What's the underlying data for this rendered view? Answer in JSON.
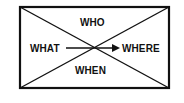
{
  "diagram": {
    "labels": {
      "top": "WHO",
      "left": "WHAT",
      "right": "WHERE",
      "bottom": "WHEN"
    },
    "stroke_color": "#111111",
    "background": "#ffffff"
  }
}
